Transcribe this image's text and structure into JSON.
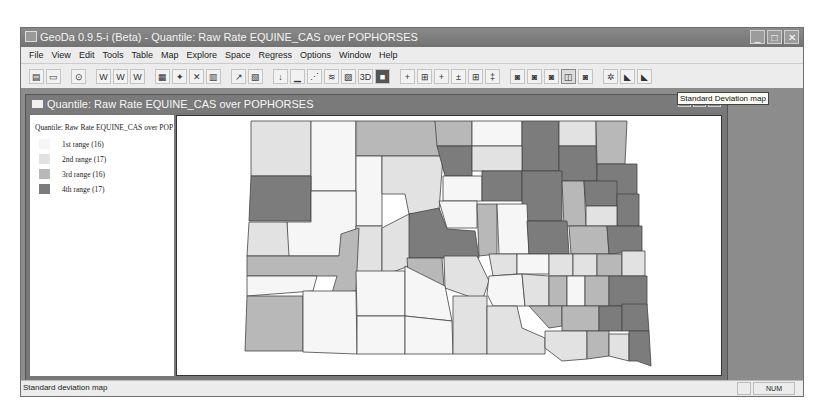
{
  "window": {
    "title": "GeoDa 0.9.5-i (Beta) - Quantile: Raw Rate EQUINE_CAS over POPHORSES",
    "controls": [
      "minimize",
      "maximize",
      "close"
    ]
  },
  "menubar": {
    "items": [
      "File",
      "View",
      "Edit",
      "Tools",
      "Table",
      "Map",
      "Explore",
      "Space",
      "Regress",
      "Options",
      "Window",
      "Help"
    ]
  },
  "toolbar": {
    "groups": [
      [
        "open-project",
        "close-project"
      ],
      [
        "centroid",
        "weights-create",
        "weights-open",
        "weights-properties"
      ],
      [
        "map-quantile",
        "map-percentile",
        "scatter",
        "box",
        "lisa",
        "lisa-cluster"
      ],
      [
        "pointer",
        "histogram",
        "scatter-plot",
        "parallel-coords",
        "3d",
        "print"
      ],
      [
        "moran",
        "moran-rate",
        "bivariate-moran",
        "lisa-univariate",
        "lisa-map",
        "lisa-rate"
      ],
      [
        "map-1",
        "map-2",
        "map-3",
        "std-dev-map",
        "map-5",
        "smooth",
        "rate-1",
        "rate-2"
      ]
    ],
    "tooltip": "Standard Deviation map"
  },
  "child_window": {
    "title": "Quantile: Raw Rate EQUINE_CAS over POPHORSES",
    "legend": {
      "title": "Quantile: Raw Rate EQUINE_CAS over POPHORSES",
      "items": [
        {
          "label": "1st range (16)",
          "color": "#f6f6f6"
        },
        {
          "label": "2nd range (17)",
          "color": "#e2e2e2"
        },
        {
          "label": "3rd range (16)",
          "color": "#b8b8b8"
        },
        {
          "label": "4th range (17)",
          "color": "#7c7c7c"
        }
      ]
    }
  },
  "statusbar": {
    "message": "Standard deviation map",
    "num": "NUM"
  }
}
